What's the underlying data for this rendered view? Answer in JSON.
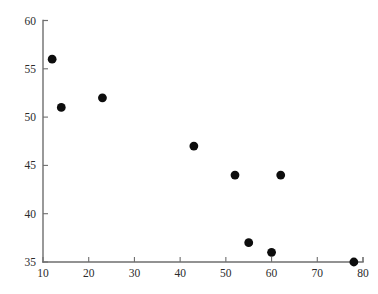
{
  "chart_data": {
    "type": "scatter",
    "title": "",
    "subtitle": "",
    "xlabel": "",
    "ylabel": "",
    "xlim": [
      10,
      80
    ],
    "ylim": [
      35,
      60
    ],
    "xticks": [
      10,
      20,
      30,
      40,
      50,
      60,
      70,
      80
    ],
    "xtick_labels": [
      "10",
      "20",
      "30",
      "40",
      "50",
      "60",
      "70",
      "80"
    ],
    "yticks": [
      35,
      40,
      45,
      50,
      55,
      60
    ],
    "ytick_labels": [
      "35",
      "40",
      "45",
      "50",
      "55",
      "60"
    ],
    "grid": false,
    "legend": null,
    "marker": "filled-circle",
    "marker_color": "#0d0d0d",
    "axis_color": "#6e6e6e",
    "background_color": "#ffffff",
    "series": [
      {
        "name": "data",
        "points": [
          {
            "x": 12,
            "y": 56
          },
          {
            "x": 14,
            "y": 51
          },
          {
            "x": 23,
            "y": 52
          },
          {
            "x": 43,
            "y": 47
          },
          {
            "x": 52,
            "y": 44
          },
          {
            "x": 55,
            "y": 37
          },
          {
            "x": 60,
            "y": 36
          },
          {
            "x": 62,
            "y": 44
          },
          {
            "x": 78,
            "y": 35
          }
        ]
      }
    ]
  }
}
